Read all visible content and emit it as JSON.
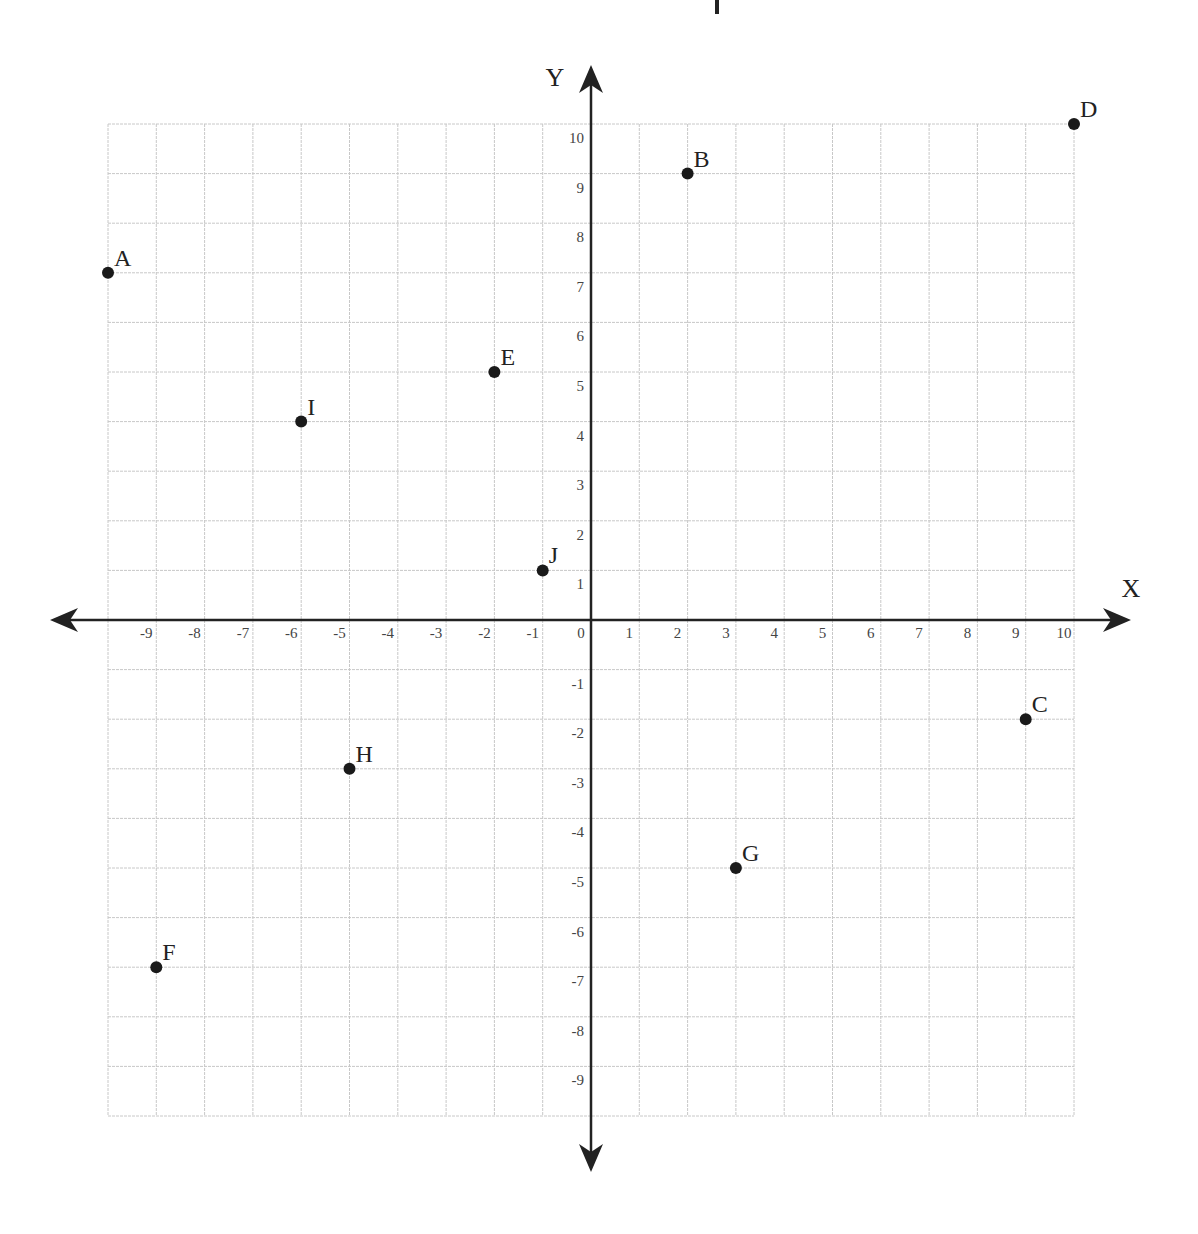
{
  "chart_data": {
    "type": "scatter",
    "title": "",
    "xlabel": "X",
    "ylabel": "Y",
    "xlim": [
      -10,
      10
    ],
    "ylim": [
      -10,
      10
    ],
    "grid": true,
    "x_ticks": [
      "-9",
      "-8",
      "-7",
      "-6",
      "-5",
      "-4",
      "-3",
      "-2",
      "-1",
      "0",
      "1",
      "2",
      "3",
      "4",
      "5",
      "6",
      "7",
      "8",
      "9",
      "10"
    ],
    "x_tick_values": [
      -9,
      -8,
      -7,
      -6,
      -5,
      -4,
      -3,
      -2,
      -1,
      0,
      1,
      2,
      3,
      4,
      5,
      6,
      7,
      8,
      9,
      10
    ],
    "y_ticks": [
      "10",
      "9",
      "8",
      "7",
      "6",
      "5",
      "4",
      "3",
      "2",
      "1",
      "-1",
      "-2",
      "-3",
      "-4",
      "-5",
      "-6",
      "-7",
      "-8",
      "-9"
    ],
    "y_tick_values": [
      10,
      9,
      8,
      7,
      6,
      5,
      4,
      3,
      2,
      1,
      -1,
      -2,
      -3,
      -4,
      -5,
      -6,
      -7,
      -8,
      -9
    ],
    "points": [
      {
        "label": "A",
        "x": -10,
        "y": 7
      },
      {
        "label": "B",
        "x": 2,
        "y": 9
      },
      {
        "label": "C",
        "x": 9,
        "y": -2
      },
      {
        "label": "D",
        "x": 10,
        "y": 10
      },
      {
        "label": "E",
        "x": -2,
        "y": 5
      },
      {
        "label": "F",
        "x": -9,
        "y": -7
      },
      {
        "label": "G",
        "x": 3,
        "y": -5
      },
      {
        "label": "H",
        "x": -5,
        "y": -3
      },
      {
        "label": "I",
        "x": -6,
        "y": 4
      },
      {
        "label": "J",
        "x": -1,
        "y": 1
      }
    ]
  },
  "colors": {
    "grid": "#c8c8c8",
    "axis": "#222222",
    "point": "#1a1a1a",
    "text": "#222222",
    "tick_text": "#444444"
  }
}
